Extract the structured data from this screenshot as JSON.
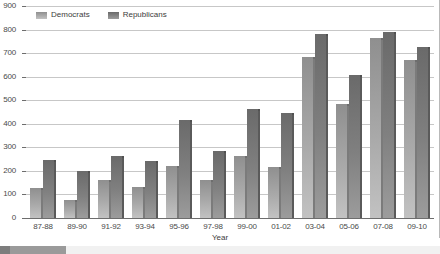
{
  "chart_data": {
    "type": "bar",
    "title": "",
    "xlabel": "Year",
    "ylabel": "",
    "ylim": [
      0,
      900
    ],
    "ytick_step": 100,
    "grid": true,
    "legend_position": "top-left",
    "categories": [
      "87-88",
      "89-90",
      "91-92",
      "93-94",
      "95-96",
      "97-98",
      "99-00",
      "01-02",
      "03-04",
      "05-06",
      "07-08",
      "09-10"
    ],
    "series": [
      {
        "name": "Democrats",
        "color": "#a9a9a9",
        "values": [
          128,
          78,
          162,
          133,
          220,
          160,
          262,
          215,
          685,
          485,
          765,
          672
        ]
      },
      {
        "name": "Republicans",
        "color": "#808080",
        "values": [
          248,
          198,
          262,
          242,
          415,
          285,
          462,
          445,
          782,
          608,
          788,
          728
        ]
      }
    ],
    "yticks": [
      "900",
      "800",
      "700",
      "600",
      "500",
      "400",
      "300",
      "200",
      "100",
      "0"
    ]
  },
  "legend": {
    "items": [
      {
        "label": "Democrats",
        "swatch": "legend-swatch-democrats"
      },
      {
        "label": "Republicans",
        "swatch": "legend-swatch-republicans"
      }
    ]
  },
  "axis": {
    "x_title": "Year"
  },
  "scrollbar": {
    "orientation": "horizontal",
    "thumb_position": "left"
  }
}
